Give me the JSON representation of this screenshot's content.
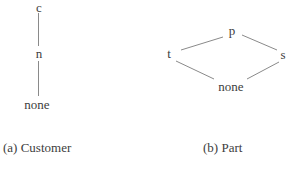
{
  "figure": {
    "diagram_a": {
      "caption": "(a) Customer",
      "nodes": {
        "top": "c",
        "middle": "n",
        "bottom": "none"
      },
      "edges": [
        [
          "c",
          "n"
        ],
        [
          "n",
          "none"
        ]
      ]
    },
    "diagram_b": {
      "caption": "(b) Part",
      "nodes": {
        "top": "p",
        "left": "t",
        "right": "s",
        "bottom": "none"
      },
      "edges": [
        [
          "p",
          "t"
        ],
        [
          "p",
          "s"
        ],
        [
          "t",
          "none"
        ],
        [
          "s",
          "none"
        ]
      ]
    },
    "colors": {
      "background": "#ffffff",
      "text": "#3d3d3d",
      "edge": "#8a8a8a"
    }
  }
}
